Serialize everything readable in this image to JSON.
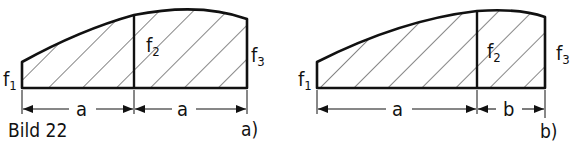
{
  "figure": {
    "caption": "Bild 22",
    "colors": {
      "ink": "#111111",
      "background": "#ffffff",
      "hatch": "#222222"
    },
    "panels": [
      {
        "id": "a",
        "tag": "a)",
        "labels": {
          "f1": {
            "base": "f",
            "sub": "1"
          },
          "f2": {
            "base": "f",
            "sub": "2"
          },
          "f3": {
            "base": "f",
            "sub": "3"
          }
        },
        "dimensions": [
          "a",
          "a"
        ]
      },
      {
        "id": "b",
        "tag": "b)",
        "labels": {
          "f1": {
            "base": "f",
            "sub": "1"
          },
          "f2": {
            "base": "f",
            "sub": "2"
          },
          "f3": {
            "base": "f",
            "sub": "3"
          }
        },
        "dimensions": [
          "a",
          "b"
        ]
      }
    ]
  }
}
